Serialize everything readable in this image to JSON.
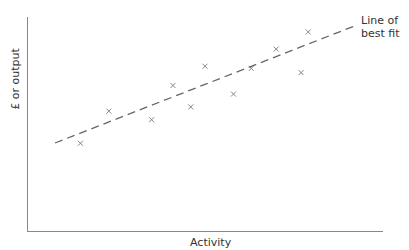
{
  "chart_data": {
    "type": "scatter",
    "title": "",
    "xlabel": "Activity",
    "ylabel": "£ or output",
    "grid": false,
    "legend": null,
    "annotations": [
      {
        "text": "Line of best fit",
        "lines": [
          "Line of",
          "best fit"
        ],
        "position": "end of trend line, top right"
      }
    ],
    "x_ticks": [],
    "y_ticks": [],
    "xlim": [
      0,
      100
    ],
    "ylim": [
      0,
      100
    ],
    "points": [
      {
        "x": 15,
        "y": 41
      },
      {
        "x": 23,
        "y": 56
      },
      {
        "x": 35,
        "y": 52
      },
      {
        "x": 41,
        "y": 68
      },
      {
        "x": 46,
        "y": 58
      },
      {
        "x": 50,
        "y": 77
      },
      {
        "x": 58,
        "y": 64
      },
      {
        "x": 63,
        "y": 76
      },
      {
        "x": 70,
        "y": 85
      },
      {
        "x": 77,
        "y": 74
      },
      {
        "x": 79,
        "y": 93
      }
    ],
    "trend_line": {
      "style": "dashed",
      "from": {
        "x": 8,
        "y": 41
      },
      "to": {
        "x": 93,
        "y": 96
      }
    },
    "marker": "x",
    "colors": {
      "axes": "#888888",
      "markers": "#777777",
      "trend_line": "#666666",
      "text": "#333333"
    }
  }
}
